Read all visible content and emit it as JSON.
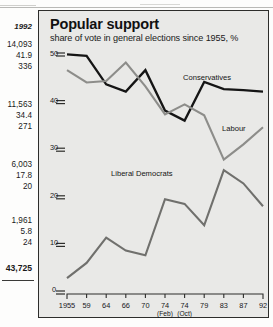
{
  "panel": {
    "title": "Popular support",
    "subtitle": "share of vote in general elections since 1955, %"
  },
  "side_column": {
    "year_header": "1992",
    "groups": [
      {
        "value": "14,093",
        "pct": "41.9",
        "seats": "336"
      },
      {
        "value": "11,563",
        "pct": "34.4",
        "seats": "271"
      },
      {
        "value": "6,003",
        "pct": "17.8",
        "seats": "20"
      },
      {
        "value": "1,961",
        "pct": "5.8",
        "seats": "24"
      }
    ],
    "total": "43,725"
  },
  "colors": {
    "conservatives": "#151515",
    "labour": "#8d8d8a",
    "libdems": "#70706d",
    "panel_bg": "#e9e9e7",
    "panel_border": "#2d2d2b",
    "axis": "#2d2d2b"
  },
  "chart_data": {
    "type": "line",
    "title": "Popular support",
    "subtitle": "share of vote in general elections since 1955, %",
    "xlabel": "",
    "ylabel": "share of vote, %",
    "ylim": [
      0,
      50
    ],
    "yticks": [
      0,
      10,
      20,
      30,
      40,
      50
    ],
    "grid": false,
    "legend": "inline-labels",
    "categories": [
      "1955",
      "59",
      "64",
      "66",
      "70",
      "74",
      "74",
      "79",
      "83",
      "87",
      "92"
    ],
    "category_sublabels": [
      "",
      "",
      "",
      "",
      "",
      "(Feb)",
      "(Oct)",
      "",
      "",
      "",
      ""
    ],
    "series": [
      {
        "name": "Conservatives",
        "color": "#151515",
        "values": [
          49.7,
          49.4,
          43.4,
          41.9,
          46.4,
          37.9,
          35.8,
          43.9,
          42.4,
          42.2,
          41.9
        ]
      },
      {
        "name": "Labour",
        "color": "#8d8d8a",
        "values": [
          46.4,
          43.8,
          44.1,
          48.0,
          43.0,
          37.1,
          39.2,
          36.9,
          27.6,
          30.8,
          34.4
        ]
      },
      {
        "name": "Liberal Democrats",
        "color": "#70706d",
        "values": [
          2.7,
          5.9,
          11.2,
          8.5,
          7.5,
          19.3,
          18.3,
          13.8,
          25.4,
          22.6,
          17.8
        ]
      }
    ],
    "annotations": [
      {
        "text": "Conservatives",
        "series": "Conservatives"
      },
      {
        "text": "Labour",
        "series": "Labour"
      },
      {
        "text": "Liberal Democrats",
        "series": "Liberal Democrats"
      }
    ]
  }
}
